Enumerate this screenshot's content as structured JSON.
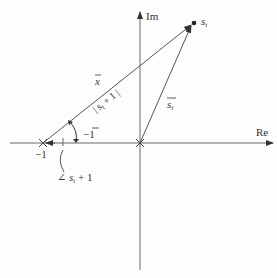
{
  "diagram": {
    "type": "complex-plane-vector-diagram",
    "axes": {
      "real_label": "Re",
      "imag_label": "Im"
    },
    "points": [
      {
        "name": "minus-one",
        "label": "−1",
        "marker": "cross"
      },
      {
        "name": "origin",
        "label": "",
        "marker": "cross"
      },
      {
        "name": "s_t",
        "label": "s",
        "subscript": "t",
        "marker": "dot"
      }
    ],
    "vectors": [
      {
        "name": "x-vector",
        "label": "x",
        "overbar": true,
        "magnitude_label": "| s",
        "magnitude_sub": "t",
        "magnitude_tail": " + 1 |"
      },
      {
        "name": "s-t-vector",
        "label": "s",
        "subscript": "t",
        "overbar": true
      },
      {
        "name": "minus-one-vector",
        "label": "−1",
        "overbar": true
      }
    ],
    "angle": {
      "label_prefix": "∠ s",
      "label_sub": "t",
      "label_tail": " + 1"
    },
    "colors": {
      "lines": "#555555",
      "text": "#333333"
    }
  }
}
